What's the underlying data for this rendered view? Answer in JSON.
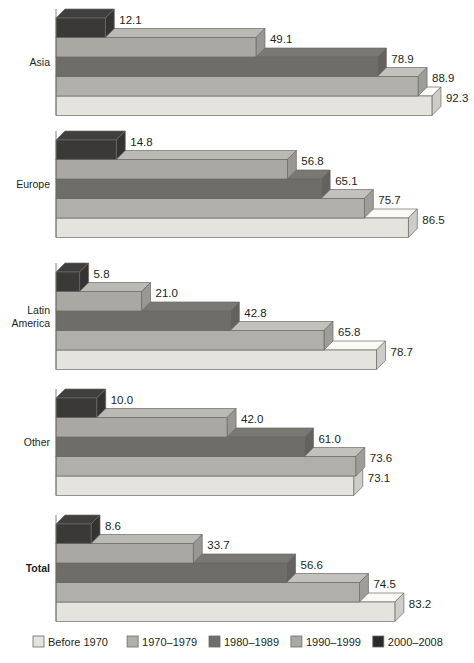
{
  "chart_data": {
    "type": "bar",
    "title": "",
    "subtitle": "",
    "xlabel": "",
    "ylabel": "",
    "orientation": "horizontal",
    "style": "3d-stepped-horizontal-bars",
    "grid": false,
    "legend_position": "bottom",
    "xlim": [
      0,
      100
    ],
    "categories": [
      "Asia",
      "Europe",
      "Latin America",
      "Other",
      "Total"
    ],
    "series": [
      {
        "name": "Before 1970",
        "color": "#e4e3de",
        "values": [
          92.3,
          86.5,
          78.7,
          73.1,
          83.2
        ]
      },
      {
        "name": "1970–1979",
        "color": "#b0afaa",
        "values": [
          88.9,
          75.7,
          65.8,
          73.6,
          74.5
        ]
      },
      {
        "name": "1980–1989",
        "color": "#6e6d68",
        "values": [
          78.9,
          65.1,
          42.8,
          61.0,
          56.6
        ]
      },
      {
        "name": "1990–1999",
        "color": "#a9a8a3",
        "values": [
          49.1,
          56.8,
          21.0,
          42.0,
          33.7
        ]
      },
      {
        "name": "2000–2008",
        "color": "#3a3937",
        "values": [
          12.1,
          14.8,
          5.8,
          10.0,
          8.6
        ]
      }
    ],
    "value_labels": {
      "Asia": [
        "12.1",
        "49.1",
        "78.9",
        "88.9",
        "92.3"
      ],
      "Europe": [
        "14.8",
        "56.8",
        "65.1",
        "75.7",
        "86.5"
      ],
      "Latin America": [
        "5.8",
        "21.0",
        "42.8",
        "65.8",
        "78.7"
      ],
      "Other": [
        "10.0",
        "42.0",
        "61.0",
        "73.6",
        "73.1"
      ],
      "Total": [
        "8.6",
        "33.7",
        "56.6",
        "74.5",
        "83.2"
      ]
    },
    "bar_order_top_to_bottom": [
      "2000–2008",
      "1990–1999",
      "1980–1989",
      "1970–1979",
      "Before 1970"
    ],
    "bold_categories": [
      "Total"
    ]
  },
  "categories": [
    {
      "id": "asia",
      "label": "Asia",
      "lines": [
        "Asia"
      ],
      "bold": false
    },
    {
      "id": "europe",
      "label": "Europe",
      "lines": [
        "Europe"
      ],
      "bold": false
    },
    {
      "id": "latin",
      "label": "Latin America",
      "lines": [
        "Latin",
        "America"
      ],
      "bold": false
    },
    {
      "id": "other",
      "label": "Other",
      "lines": [
        "Other"
      ],
      "bold": false
    },
    {
      "id": "total",
      "label": "Total",
      "lines": [
        "Total"
      ],
      "bold": true
    }
  ],
  "legend": {
    "items": [
      {
        "label": "Before 1970",
        "color": "#e4e3de"
      },
      {
        "label": "1970–1979",
        "color": "#b0afaa"
      },
      {
        "label": "1980–1989",
        "color": "#6e6d68"
      },
      {
        "label": "1990–1999",
        "color": "#a9a8a3"
      },
      {
        "label": "2000–2008",
        "color": "#2b2a28"
      }
    ]
  },
  "colors": {
    "before_1970": "#e4e3de",
    "s1970_1979": "#b0afaa",
    "s1980_1989": "#6e6d68",
    "s1990_1999": "#a9a8a3",
    "s2000_2008": "#3a3937",
    "outline": "#6b6a66",
    "text": "#231f20",
    "background": "#ffffff"
  }
}
